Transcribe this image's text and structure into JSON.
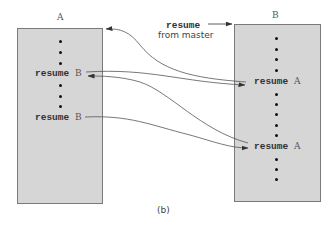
{
  "diagram": {
    "caption": "(b)",
    "coroutine_a": {
      "label": "A",
      "statements": [
        {
          "keyword": "resume",
          "target": "B"
        },
        {
          "keyword": "resume",
          "target": "B"
        }
      ]
    },
    "coroutine_b": {
      "label": "B",
      "statements": [
        {
          "keyword": "resume",
          "target": "A"
        },
        {
          "keyword": "resume",
          "target": "A"
        }
      ]
    },
    "master_note": {
      "keyword": "resume",
      "text": "from master"
    }
  }
}
